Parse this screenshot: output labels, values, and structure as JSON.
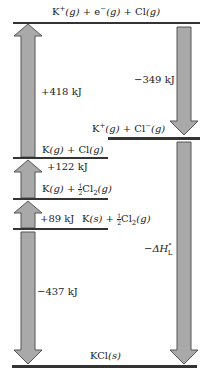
{
  "diagram": {
    "arrow_color": "#a9a9a9",
    "arrow_stroke": "#555555",
    "line_color": "#333333",
    "levels": [
      {
        "id": "top",
        "species": [
          "K",
          "+",
          "(g)",
          " + e",
          "−",
          "(g)",
          " + Cl(g)"
        ],
        "text": "K⁺(g) + e⁻(g) + Cl(g)"
      },
      {
        "id": "ions",
        "text": "K⁺(g) + Cl⁻(g)"
      },
      {
        "id": "atoms",
        "text": "K(g) + Cl(g)"
      },
      {
        "id": "kgas",
        "text": "K(g) + ½Cl₂(g)"
      },
      {
        "id": "elements",
        "text": "K(s) + ½Cl₂(g)"
      },
      {
        "id": "product",
        "text": "KCl(s)"
      }
    ],
    "steps": [
      {
        "id": "ionization",
        "label": "+418 kJ",
        "direction": "up"
      },
      {
        "id": "electron-affinity",
        "label": "−349 kJ",
        "direction": "down"
      },
      {
        "id": "dissociation",
        "label": "+122 kJ",
        "direction": "up"
      },
      {
        "id": "sublimation",
        "label": "+89 kJ",
        "direction": "up"
      },
      {
        "id": "formation",
        "label": "−437 kJ",
        "direction": "down"
      },
      {
        "id": "lattice",
        "label": "−ΔH",
        "sub": "L",
        "sup": "°",
        "direction": "down"
      }
    ],
    "parts": {
      "K": "K",
      "plus": "+",
      "minus": "−",
      "e": "e",
      "Cl": "Cl",
      "Cl2": "Cl",
      "two": "2",
      "g": "(g)",
      "s": "(s)",
      "half_num": "1",
      "half_den": "2",
      "sep": " + ",
      "KCl": "KCl",
      "lattice_prefix": "−ΔH",
      "lattice_sub": "L",
      "lattice_sup": "°"
    }
  }
}
